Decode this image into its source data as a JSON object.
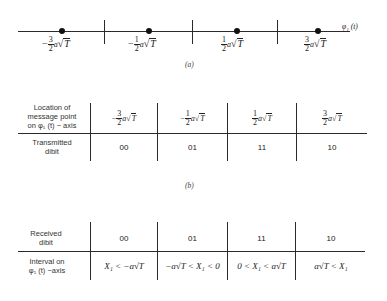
{
  "panel_a": {
    "axis_label": "φ₁ (t)",
    "points": [
      {
        "sign": "−",
        "num": "3",
        "den": "2",
        "a": "a",
        "root": "T"
      },
      {
        "sign": "−",
        "num": "1",
        "den": "2",
        "a": "a",
        "root": "T"
      },
      {
        "sign": "",
        "num": "1",
        "den": "2",
        "a": "a",
        "root": "T"
      },
      {
        "sign": "",
        "num": "3",
        "den": "2",
        "a": "a",
        "root": "T"
      }
    ],
    "caption": "(a)"
  },
  "panel_b": {
    "row1_header": "Location of message point on φ₁ (t) − axis",
    "row1_header_lines": [
      "Location of",
      "message point",
      "on φ₁ (t) − axis"
    ],
    "row2_header_lines": [
      "Transmitted",
      "dibit"
    ],
    "dibits": [
      "00",
      "01",
      "11",
      "10"
    ],
    "caption": "(b)"
  },
  "panel_c": {
    "row1_header_lines": [
      "Received",
      "dibit"
    ],
    "row2_header_lines": [
      "Interval on",
      "φ₁ (t) −axis"
    ],
    "dibits": [
      "00",
      "01",
      "11",
      "10"
    ],
    "intervals": [
      "X₁ < −a√T",
      "−a√T < X₁ < 0",
      "0 < X₁ < a√T",
      "a√T < X₁"
    ]
  }
}
